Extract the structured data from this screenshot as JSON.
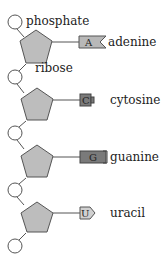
{
  "diagram": {
    "labels": {
      "phosphate": "phosphate",
      "ribose": "ribose"
    },
    "colors": {
      "stroke": "#555555",
      "sugar_fill": "#bdbdbd",
      "base_fill": "#b8b8b8",
      "base_dark_fill": "#7a7a7a",
      "circle_fill": "#ffffff"
    },
    "nucleotides": [
      {
        "letter": "A",
        "name": "adenine",
        "shape": "notch"
      },
      {
        "letter": "C",
        "name": "cytosine",
        "shape": "bump"
      },
      {
        "letter": "G",
        "name": "guanine",
        "shape": "rect-bracket"
      },
      {
        "letter": "U",
        "name": "uracil",
        "shape": "point"
      }
    ]
  }
}
